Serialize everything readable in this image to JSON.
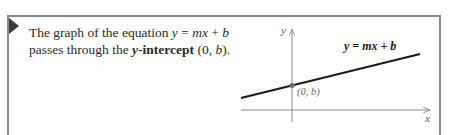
{
  "statement": {
    "part1": "The graph of the equation ",
    "equation_y": "y",
    "equation_eq": " = ",
    "equation_mx": "mx",
    "equation_plus": " + ",
    "equation_b": "b",
    "part2": "passes through the ",
    "term_y": "y",
    "term_rest": "-intercept",
    "point_open": " (0, ",
    "point_b": "b",
    "point_close": ")."
  },
  "graph": {
    "y_axis_label": "y",
    "x_axis_label": "x",
    "line_label": "y = mx + b",
    "intercept_label": "(0, b)",
    "line_color": "#1a1a1a",
    "axis_color": "#8a8a8a",
    "point_color": "#6a6a6a"
  }
}
